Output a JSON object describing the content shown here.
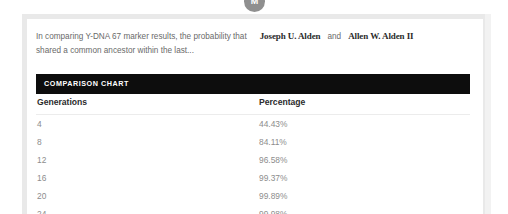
{
  "avatar": {
    "initial": "M",
    "color": "#8f8f8f"
  },
  "intro": {
    "line1_prefix": "In comparing Y-DNA 67 marker results, the probability that",
    "person_a": "Joseph U. Alden",
    "conjunction": "and",
    "person_b": "Allen W. Alden II",
    "line2": "shared a common ancestor within the last..."
  },
  "section": {
    "title": "COMPARISON CHART",
    "bar_color": "#0d0d0d"
  },
  "chart_data": {
    "type": "table",
    "title": "COMPARISON CHART",
    "columns": [
      "Generations",
      "Percentage"
    ],
    "xlabel": "Generations",
    "ylabel": "Percentage",
    "categories": [
      "4",
      "8",
      "12",
      "16",
      "20",
      "24"
    ],
    "values": [
      44.43,
      84.11,
      96.58,
      99.37,
      99.89,
      99.98
    ],
    "rows": [
      {
        "generations": "4",
        "percentage": "44.43%"
      },
      {
        "generations": "8",
        "percentage": "84.11%"
      },
      {
        "generations": "12",
        "percentage": "96.58%"
      },
      {
        "generations": "16",
        "percentage": "99.37%"
      },
      {
        "generations": "20",
        "percentage": "99.89%"
      },
      {
        "generations": "24",
        "percentage": "99.98%"
      }
    ]
  }
}
